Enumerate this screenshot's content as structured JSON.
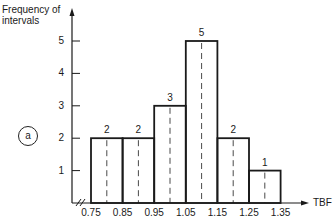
{
  "chart_data": {
    "type": "bar",
    "title": "",
    "xlabel": "TBF",
    "ylabel": "Frequency of intervals",
    "ylabel_lines": [
      "Frequency of",
      "intervals"
    ],
    "bin_edges": [
      "0.75",
      "0.85",
      "0.95",
      "1.05",
      "1.15",
      "1.25",
      "1.35"
    ],
    "categories": [
      "0.75-0.85",
      "0.85-0.95",
      "0.95-1.05",
      "1.05-1.15",
      "1.15-1.25",
      "1.25-1.35"
    ],
    "values": [
      2,
      2,
      3,
      5,
      2,
      1
    ],
    "value_labels": [
      "2",
      "2",
      "3",
      "5",
      "2",
      "1"
    ],
    "y_ticks": [
      "1",
      "2",
      "3",
      "4",
      "5"
    ],
    "ylim": [
      0,
      5.9
    ],
    "grid": false,
    "annotations": [
      "a"
    ],
    "dashed_bin_midlines": true,
    "axis_break_on_x": true
  },
  "labels": {
    "ylabel_line1": "Frequency of",
    "ylabel_line2": "intervals",
    "xlabel": "TBF",
    "panel_badge": "a"
  },
  "colors": {
    "ink": "#1a1a1a",
    "background": "#ffffff"
  }
}
